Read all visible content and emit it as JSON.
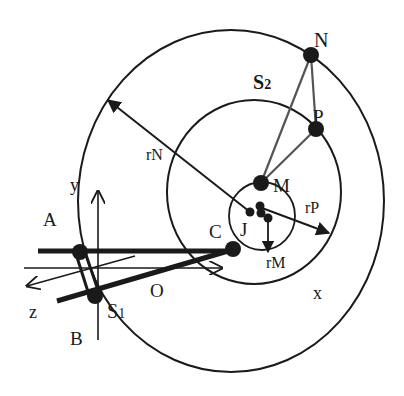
{
  "figure": {
    "colors": {
      "ink": "#1a1a1a",
      "background": "#ffffff",
      "triangle": "#555555"
    }
  },
  "labels": {
    "N": "N",
    "P": "P",
    "M": "M",
    "S2": "S",
    "S2_sub": "2",
    "S1": "S",
    "S1_sub": "1",
    "J": "J",
    "C": "C",
    "A": "A",
    "B": "B",
    "O": "O",
    "x": "x",
    "y": "y",
    "z": "z",
    "rN": "rN",
    "rP": "rP",
    "rM": "rM"
  },
  "points": [
    {
      "name": "N",
      "x": 311,
      "y": 55
    },
    {
      "name": "P",
      "x": 316,
      "y": 129
    },
    {
      "name": "M",
      "x": 261,
      "y": 183
    },
    {
      "name": "J",
      "x": 250,
      "y": 212
    },
    {
      "name": "C",
      "x": 233,
      "y": 249
    },
    {
      "name": "A",
      "x": 80,
      "y": 252
    },
    {
      "name": "S1",
      "x": 95,
      "y": 296
    }
  ],
  "orbits": [
    {
      "name": "outer",
      "through": "N",
      "cx": 231,
      "cy": 201,
      "rx": 153,
      "ry": 171
    },
    {
      "name": "middle",
      "through": "P",
      "cx": 254,
      "cy": 192,
      "rx": 87,
      "ry": 92
    },
    {
      "name": "inner",
      "through": "M",
      "cx": 262,
      "cy": 216,
      "rx": 33,
      "ry": 34
    }
  ],
  "vectors": [
    {
      "label": "rN",
      "from": [
        250,
        212
      ],
      "to": [
        107,
        99
      ]
    },
    {
      "label": "rP",
      "from": [
        262,
        208
      ],
      "to": [
        330,
        233
      ]
    },
    {
      "label": "rM",
      "from": [
        268,
        218
      ],
      "to": [
        268,
        252
      ]
    }
  ],
  "axes": [
    {
      "label": "y",
      "from": [
        98,
        340
      ],
      "to": [
        98,
        190
      ]
    },
    {
      "label": "x",
      "from": [
        24,
        268
      ],
      "to": [
        222,
        268
      ]
    },
    {
      "label": "z",
      "from": [
        135,
        256
      ],
      "to": [
        26,
        286
      ]
    }
  ]
}
